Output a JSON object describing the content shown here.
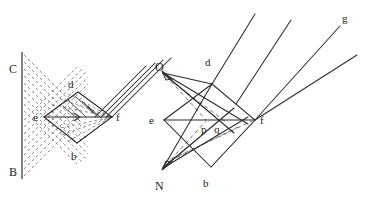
{
  "figure": {
    "background_color": "#ffffff",
    "ink_color": "#2b2b2b",
    "dash_color": "#6f6f74",
    "width": 368,
    "height": 197
  },
  "left_panel": {
    "name": "left-diagram",
    "description": "Vertical barrier line with labelled endpoints C and B, a diamond (rhombus) prism with vertices d (top), b (bottom), e (left), f (right), a family of dashed rays converging from the barrier, and four solid parallel rays leaving to the upper right.",
    "labels": [
      {
        "id": "C",
        "text": "C",
        "x": 13,
        "y": 69
      },
      {
        "id": "B",
        "text": "B",
        "x": 13,
        "y": 172
      },
      {
        "id": "d",
        "text": "d",
        "x": 71,
        "y": 86
      },
      {
        "id": "e",
        "text": "e",
        "x": 36,
        "y": 121
      },
      {
        "id": "f",
        "text": "f",
        "x": 118,
        "y": 121
      },
      {
        "id": "b",
        "text": "b",
        "x": 73,
        "y": 158
      }
    ],
    "barrier": {
      "x": 22,
      "y_top": 52,
      "y_bottom": 178
    },
    "diamond": {
      "left": {
        "x": 44,
        "y": 117
      },
      "top": {
        "x": 78,
        "y": 92
      },
      "right": {
        "x": 112,
        "y": 117
      },
      "bottom": {
        "x": 77,
        "y": 143
      }
    },
    "dashed_ray_count": 18,
    "parallel_ray_count": 4
  },
  "right_panel": {
    "name": "right-diagram",
    "description": "Same diamond prism with vertices d (top), b (bottom), e (left), f (right); interior points p and q on the axis; solid rays converging from point O above-left and point N below-left, with arrowheads at O and N; four solid rays exiting to the upper right, the topmost labelled g.",
    "labels": [
      {
        "id": "O",
        "text": "O",
        "x": 158,
        "y": 67
      },
      {
        "id": "N",
        "text": "N",
        "x": 157,
        "y": 186
      },
      {
        "id": "d",
        "text": "d",
        "x": 208,
        "y": 63
      },
      {
        "id": "e",
        "text": "e",
        "x": 152,
        "y": 124
      },
      {
        "id": "p",
        "text": "p",
        "x": 203,
        "y": 130
      },
      {
        "id": "q",
        "text": "q",
        "x": 216,
        "y": 130
      },
      {
        "id": "f",
        "text": "f",
        "x": 262,
        "y": 124
      },
      {
        "id": "b",
        "text": "b",
        "x": 206,
        "y": 184
      },
      {
        "id": "g",
        "text": "g",
        "x": 344,
        "y": 22
      }
    ],
    "diamond": {
      "left": {
        "x": 164,
        "y": 120
      },
      "top": {
        "x": 212,
        "y": 84
      },
      "right": {
        "x": 255,
        "y": 120
      },
      "bottom": {
        "x": 211,
        "y": 167
      }
    },
    "source_O": {
      "x": 162,
      "y": 72
    },
    "source_N": {
      "x": 162,
      "y": 169
    },
    "interior_points": [
      {
        "id": "p",
        "x": 206,
        "y": 120
      },
      {
        "id": "q",
        "x": 219,
        "y": 120
      }
    ],
    "exit_ray_count": 4,
    "exit_ray_labelled": "g"
  }
}
